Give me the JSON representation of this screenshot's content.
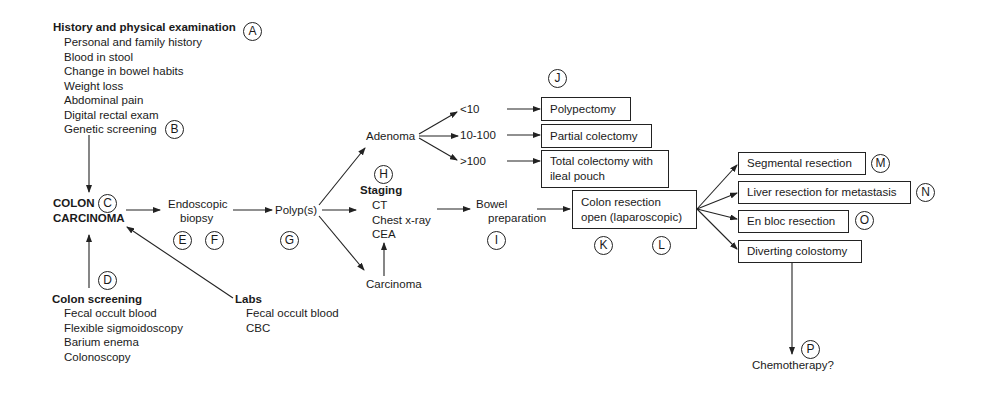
{
  "history": {
    "title": "History and physical examination",
    "label": "A",
    "items": [
      "Personal and family history",
      "Blood in stool",
      "Change in bowel habits",
      "Weight loss",
      "Abdominal pain",
      "Digital rectal exam",
      "Genetic screening"
    ],
    "genetic_label": "B"
  },
  "colon_carcinoma": {
    "line1": "COLON",
    "line2": "CARCINOMA",
    "label": "C"
  },
  "screening": {
    "label": "D",
    "title": "Colon screening",
    "items": [
      "Fecal occult blood",
      "Flexible sigmoidoscopy",
      "Barium enema",
      "Colonoscopy"
    ]
  },
  "labs": {
    "title": "Labs",
    "items": [
      "Fecal occult blood",
      "CBC"
    ]
  },
  "biopsy": {
    "line1": "Endoscopic",
    "line2": "biopsy",
    "label_e": "E",
    "label_f": "F"
  },
  "polyps": {
    "text": "Polyp(s)",
    "label": "G"
  },
  "adenoma": {
    "text": "Adenoma",
    "branches": [
      "<10",
      "10-100",
      ">100"
    ]
  },
  "staging": {
    "label": "H",
    "title": "Staging",
    "items": [
      "CT",
      "Chest x-ray",
      "CEA"
    ]
  },
  "carcinoma": {
    "text": "Carcinoma"
  },
  "bowel": {
    "line1": "Bowel",
    "line2": "preparation",
    "label": "I"
  },
  "polyp_outcomes": {
    "label": "J",
    "boxes": [
      "Polypectomy",
      "Partial colectomy",
      "Total colectomy with",
      "ileal pouch"
    ]
  },
  "resection": {
    "line1": "Colon resection",
    "line2": "open (laparoscopic)",
    "label_k": "K",
    "label_l": "L"
  },
  "outcomes": [
    {
      "text": "Segmental resection",
      "label": "M"
    },
    {
      "text": "Liver resection for metastasis",
      "label": "N"
    },
    {
      "text": "En bloc resection",
      "label": "O"
    },
    {
      "text": "Diverting colostomy",
      "label": ""
    }
  ],
  "chemo": {
    "text": "Chemotherapy?",
    "label": "P"
  }
}
